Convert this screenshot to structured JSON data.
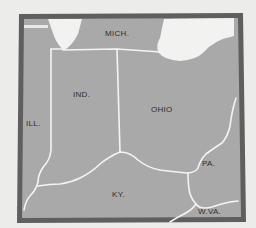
{
  "map": {
    "colors": {
      "background": "#ececea",
      "frame": "#5f5f5f",
      "land": "#a9a9a9",
      "water": "#f2f2f0",
      "border": "#f4f4f2",
      "label": "#2e2e2e"
    },
    "labels": {
      "mich": "MICH.",
      "ind": "IND.",
      "ohio": "OHIO",
      "ill": "ILL.",
      "pa": "PA.",
      "ky": "KY.",
      "wva": "W.VA."
    }
  }
}
